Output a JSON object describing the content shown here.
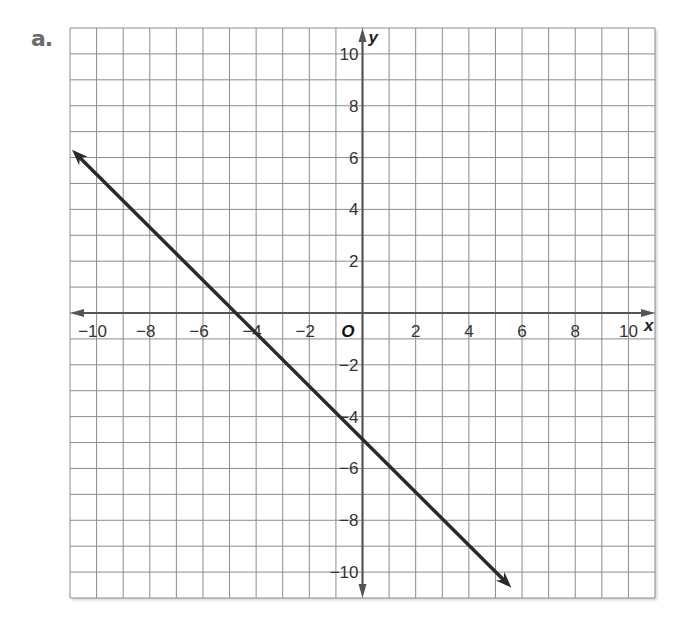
{
  "problem": {
    "label": "a."
  },
  "chart_data": {
    "type": "line",
    "title": "",
    "xlabel": "x",
    "ylabel": "y",
    "origin_label": "O",
    "xlim": [
      -11,
      11
    ],
    "ylim": [
      -11,
      11
    ],
    "grid": true,
    "grid_step": 1,
    "x_ticks": [
      -10,
      -8,
      -6,
      -4,
      -2,
      2,
      4,
      6,
      8,
      10
    ],
    "x_tick_labels": [
      "−10",
      "−8",
      "−6",
      "−4",
      "−2",
      "2",
      "4",
      "6",
      "8",
      "10"
    ],
    "y_ticks": [
      10,
      8,
      6,
      4,
      2,
      -2,
      -4,
      -6,
      -8,
      -10
    ],
    "y_tick_labels": [
      "10",
      "8",
      "6",
      "4",
      "2",
      "−2",
      "−4",
      "−6",
      "−8",
      "−10"
    ],
    "series": [
      {
        "name": "line",
        "equation": "y = -x - 5",
        "slope": -1,
        "y_intercept": -5,
        "x_intercept": -5,
        "points": [
          [
            -11,
            6.3
          ],
          [
            -5,
            0
          ],
          [
            0,
            -5
          ],
          [
            5.6,
            -10.6
          ]
        ],
        "arrows_both_ends": true,
        "color": "#2a2a2a"
      }
    ],
    "legend": null
  },
  "colors": {
    "grid": "#8c8c8c",
    "axis": "#555555",
    "line": "#2a2a2a",
    "label": "#6b6b6b"
  }
}
